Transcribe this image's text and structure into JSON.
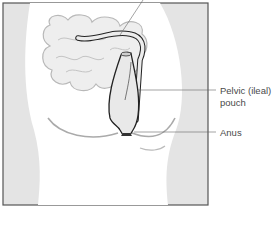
{
  "diagram": {
    "labels": {
      "pouch_line1": "Pelvic (ileal)",
      "pouch_line2": "pouch",
      "anus": "Anus"
    },
    "colors": {
      "frame": "#555555",
      "body_shade": "#e3e3e3",
      "intestine_fill": "#ededed",
      "outline": "#222222"
    }
  }
}
